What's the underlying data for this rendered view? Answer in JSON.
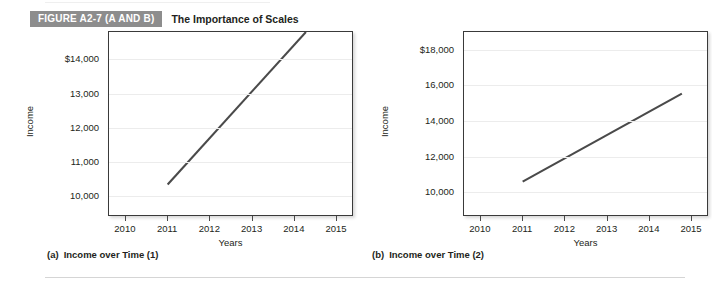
{
  "figure": {
    "badge": "FIGURE A2-7 (A AND B)",
    "title": "The Importance of Scales"
  },
  "chart_data": [
    {
      "type": "line",
      "panel": "a",
      "caption_tag": "(a)",
      "caption_text": "Income over Time (1)",
      "xlabel": "Years",
      "ylabel": "Income",
      "xticklabels": [
        "2010",
        "2011",
        "2012",
        "2013",
        "2014",
        "2015"
      ],
      "xticks": [
        2010,
        2011,
        2012,
        2013,
        2014,
        2015
      ],
      "yticklabels": [
        "$14,000",
        "13,000",
        "12,000",
        "11,000",
        "10,000"
      ],
      "yticks": [
        14000,
        13000,
        12000,
        11000,
        10000
      ],
      "xlim": [
        2009.6,
        2015.4
      ],
      "ylim": [
        9400,
        14800
      ],
      "grid": true,
      "legend": "none",
      "clipped_at_top": true,
      "series": [
        {
          "name": "Income",
          "color": "#4a4a4a",
          "x": [
            2011,
            2014.3
          ],
          "values": [
            10300,
            14800
          ]
        }
      ]
    },
    {
      "type": "line",
      "panel": "b",
      "caption_tag": "(b)",
      "caption_text": "Income over Time (2)",
      "xlabel": "Years",
      "ylabel": "Income",
      "xticklabels": [
        "2010",
        "2011",
        "2012",
        "2013",
        "2014",
        "2015"
      ],
      "xticks": [
        2010,
        2011,
        2012,
        2013,
        2014,
        2015
      ],
      "yticklabels": [
        "$18,000",
        "16,000",
        "14,000",
        "12,000",
        "10,000"
      ],
      "yticks": [
        18000,
        16000,
        14000,
        12000,
        10000
      ],
      "xlim": [
        2009.6,
        2015.4
      ],
      "ylim": [
        8600,
        19000
      ],
      "grid": true,
      "legend": "none",
      "clipped_at_top": false,
      "series": [
        {
          "name": "Income",
          "color": "#4a4a4a",
          "x": [
            2011,
            2014.8
          ],
          "values": [
            10500,
            15500
          ]
        }
      ]
    }
  ]
}
